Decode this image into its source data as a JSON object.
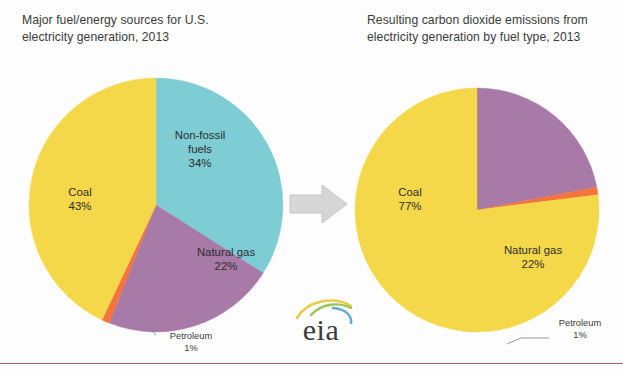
{
  "page": {
    "background_color": "#fdfdfd",
    "bottom_rule_color": "#a43a4a"
  },
  "palette": {
    "coal_yellow": "#f5d84a",
    "natural_gas_purple": "#a87aa8",
    "non_fossil_teal": "#7ecdd4",
    "petroleum_orange": "#f4743b",
    "arrow_gray": "#d6d6d6",
    "arrow_gray_border": "#c4c4c4",
    "text_dark": "#2d2d2d",
    "title_gray": "#3b3b3b"
  },
  "titles": {
    "left": "Major fuel/energy sources for U.S.\nelectricity generation, 2013",
    "right": "Resulting carbon dioxide emissions from\nelectricity generation by fuel type, 2013"
  },
  "arrow": {
    "name": "right-arrow",
    "direction": "right"
  },
  "logo": {
    "text": "eia",
    "swoosh_colors": [
      "#e8c83c",
      "#8fbf4a",
      "#5aa0cf"
    ]
  },
  "chart_data": [
    {
      "id": "left-pie",
      "type": "pie",
      "title": "Major fuel/energy sources for U.S. electricity generation, 2013",
      "unit": "%",
      "start_angle_deg": 0,
      "direction": "clockwise",
      "categories": [
        "Non-fossil fuels",
        "Natural gas",
        "Petroleum",
        "Coal"
      ],
      "values": [
        34,
        22,
        1,
        43
      ],
      "labels": [
        {
          "name": "Non-fossil fuels",
          "value": 34,
          "display": "Non-fossil\nfuels\n34%",
          "color": "#7ecdd4",
          "placement": "inside"
        },
        {
          "name": "Natural gas",
          "value": 22,
          "display": "Natural gas\n22%",
          "color": "#a87aa8",
          "placement": "inside"
        },
        {
          "name": "Petroleum",
          "value": 1,
          "display": "Petroleum\n1%",
          "color": "#f4743b",
          "placement": "callout"
        },
        {
          "name": "Coal",
          "value": 43,
          "display": "Coal\n43%",
          "color": "#f5d84a",
          "placement": "inside"
        }
      ]
    },
    {
      "id": "right-pie",
      "type": "pie",
      "title": "Resulting carbon dioxide emissions from electricity generation by fuel type, 2013",
      "unit": "%",
      "start_angle_deg": 0,
      "direction": "clockwise",
      "categories": [
        "Natural gas",
        "Petroleum",
        "Coal"
      ],
      "values": [
        22,
        1,
        77
      ],
      "labels": [
        {
          "name": "Natural gas",
          "value": 22,
          "display": "Natural gas\n22%",
          "color": "#a87aa8",
          "placement": "inside"
        },
        {
          "name": "Petroleum",
          "value": 1,
          "display": "Petroleum\n1%",
          "color": "#f4743b",
          "placement": "callout"
        },
        {
          "name": "Coal",
          "value": 77,
          "display": "Coal\n77%",
          "color": "#f5d84a",
          "placement": "inside"
        }
      ]
    }
  ]
}
